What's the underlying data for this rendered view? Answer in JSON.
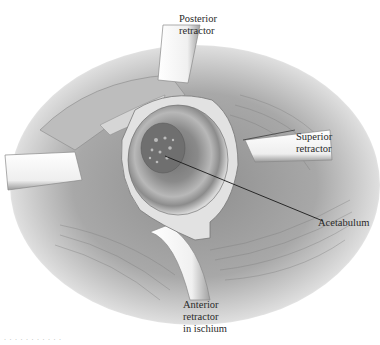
{
  "figure": {
    "background": "#ffffff",
    "colors": {
      "tissue_dark": "#6e6e6e",
      "tissue_mid": "#9a9a9a",
      "tissue_light": "#cfcfcf",
      "retractor": "#f4f4f4",
      "retractor_edge": "#8a8a8a",
      "leader_line": "#1a1a1a",
      "label_text": "#2a2a2a"
    }
  },
  "labels": {
    "posterior": {
      "line1": "Posterior",
      "line2": "retractor"
    },
    "superior": {
      "line1": "Superior",
      "line2": "retractor"
    },
    "acetabulum": {
      "line1": "Acetabulum"
    },
    "anterior": {
      "line1": "Anterior",
      "line2": "retractor",
      "line3": "in ischium"
    }
  },
  "caption": {
    "text": "· · · · · · · · · · ·"
  }
}
